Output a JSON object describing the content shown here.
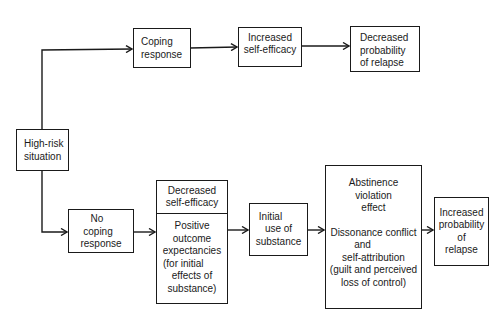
{
  "diagram": {
    "type": "flowchart",
    "nodes": {
      "high_risk": {
        "lines": [
          "High-risk",
          "situation"
        ]
      },
      "coping": {
        "lines": [
          "Coping",
          "response"
        ]
      },
      "increased_se": {
        "lines": [
          "Increased",
          "self-efficacy"
        ]
      },
      "decreased_prob": {
        "lines": [
          "Decreased",
          "probability",
          "of relapse"
        ]
      },
      "no_coping": {
        "lines": [
          "No",
          "coping",
          "response"
        ]
      },
      "decreased_se": {
        "lines": [
          "Decreased",
          "self-efficacy"
        ]
      },
      "positive_outcome": {
        "lines": [
          "Positive",
          "outcome",
          "expectancies",
          "(for initial",
          "effects of",
          "substance)"
        ]
      },
      "initial_use": {
        "lines": [
          "Initial",
          "use of",
          "substance"
        ]
      },
      "ave": {
        "section1": [
          "Abstinence",
          "violation",
          "effect"
        ],
        "section2": [
          "Dissonance conflict",
          "and",
          "self-attribution",
          "(guilt and perceived",
          "loss of control)"
        ]
      },
      "increased_prob": {
        "lines": [
          "Increased",
          "probability",
          "of",
          "relapse"
        ]
      }
    },
    "edges": [
      [
        "High-risk situation",
        "Coping response"
      ],
      [
        "Coping response",
        "Increased self-efficacy"
      ],
      [
        "Increased self-efficacy",
        "Decreased probability of relapse"
      ],
      [
        "High-risk situation",
        "No coping response"
      ],
      [
        "No coping response",
        "Decreased self-efficacy / Positive outcome expectancies"
      ],
      [
        "Decreased self-efficacy / Positive outcome expectancies",
        "Initial use of substance"
      ],
      [
        "Initial use of substance",
        "Abstinence violation effect"
      ],
      [
        "Abstinence violation effect",
        "Increased probability of relapse"
      ]
    ]
  }
}
